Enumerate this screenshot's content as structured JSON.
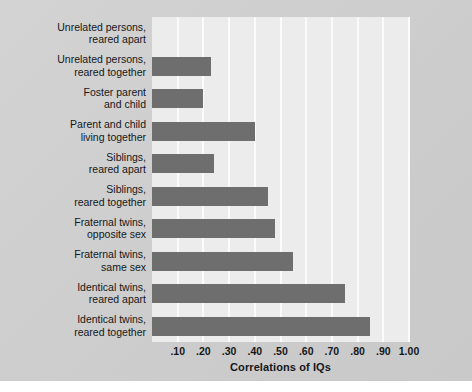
{
  "chart_data": {
    "type": "bar",
    "orientation": "horizontal",
    "title": "",
    "xlabel": "Correlations of IQs",
    "ylabel": "",
    "xlim": [
      0,
      1.0
    ],
    "grid": true,
    "legend": false,
    "bar_color": "#6e6e6e",
    "plot_background": "#ececec",
    "figure_background": "#cfcfcf",
    "xticks": [
      ".10",
      ".20",
      ".30",
      ".40",
      ".50",
      ".60",
      ".70",
      ".80",
      ".90",
      "1.00"
    ],
    "xtick_values": [
      0.1,
      0.2,
      0.3,
      0.4,
      0.5,
      0.6,
      0.7,
      0.8,
      0.9,
      1.0
    ],
    "categories": [
      "Unrelated persons, reared apart",
      "Unrelated persons, reared together",
      "Foster parent and child",
      "Parent and child living together",
      "Siblings, reared apart",
      "Siblings, reared together",
      "Fraternal twins, opposite sex",
      "Fraternal twins, same sex",
      "Identical twins, reared apart",
      "Identical twins, reared together"
    ],
    "category_lines": [
      [
        "Unrelated persons,",
        "reared apart"
      ],
      [
        "Unrelated persons,",
        "reared together"
      ],
      [
        "Foster parent",
        "and child"
      ],
      [
        "Parent and child",
        "living together"
      ],
      [
        "Siblings,",
        "reared apart"
      ],
      [
        "Siblings,",
        "reared together"
      ],
      [
        "Fraternal twins,",
        "opposite sex"
      ],
      [
        "Fraternal twins,",
        "same sex"
      ],
      [
        "Identical twins,",
        "reared apart"
      ],
      [
        "Identical twins,",
        "reared together"
      ]
    ],
    "values": [
      0.0,
      0.23,
      0.2,
      0.4,
      0.24,
      0.45,
      0.48,
      0.55,
      0.75,
      0.85
    ]
  }
}
